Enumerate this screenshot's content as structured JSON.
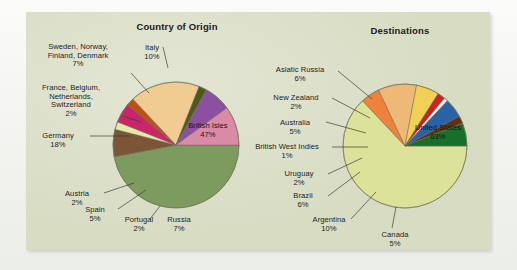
{
  "figure": {
    "background_color": "#d8dcc3",
    "page_color": "#f4f5f2"
  },
  "charts": [
    {
      "id": "country-of-origin",
      "title": "Country of Origin",
      "chart_data": {
        "type": "pie",
        "title": "Country of Origin",
        "xlabel": "",
        "ylabel": "",
        "unit": "percent",
        "start_angle_deg": 0,
        "direction": "clockwise",
        "categories": [
          "British Isles",
          "Russia",
          "Portugal",
          "Spain",
          "Austria",
          "Germany",
          "France, Belgium, Netherlands, Switzerland",
          "Sweden, Norway, Finland, Denmark",
          "Italy"
        ],
        "values": [
          47,
          7,
          2,
          5,
          2,
          18,
          2,
          7,
          10
        ],
        "colors": [
          "#7d9b5e",
          "#7c5436",
          "#e4e8a8",
          "#c9256b",
          "#b95214",
          "#f0cc93",
          "#4b5b1c",
          "#8d4fa0",
          "#d98aa6"
        ],
        "labels": [
          {
            "name": "British Isles",
            "value": "47%",
            "text": "British Isles\n47%"
          },
          {
            "name": "Russia",
            "value": "7%",
            "text": "Russia\n7%"
          },
          {
            "name": "Portugal",
            "value": "2%",
            "text": "Portugal\n2%"
          },
          {
            "name": "Spain",
            "value": "5%",
            "text": "Spain\n5%"
          },
          {
            "name": "Austria",
            "value": "2%",
            "text": "Austria\n2%"
          },
          {
            "name": "Germany",
            "value": "18%",
            "text": "Germany\n18%"
          },
          {
            "name": "France, Belgium, Netherlands, Switzerland",
            "value": "2%",
            "text": "France, Belgium,\nNetherlands,\nSwitzerland\n2%"
          },
          {
            "name": "Sweden, Norway, Finland, Denmark",
            "value": "7%",
            "text": "Sweden, Norway,\nFinland, Denmark\n7%"
          },
          {
            "name": "Italy",
            "value": "10%",
            "text": "Italy\n10%"
          }
        ]
      }
    },
    {
      "id": "destinations",
      "title": "Destinations",
      "chart_data": {
        "type": "pie",
        "title": "Destinations",
        "xlabel": "",
        "ylabel": "",
        "unit": "percent",
        "start_angle_deg": 0,
        "direction": "clockwise",
        "categories": [
          "United States",
          "Canada",
          "Argentina",
          "Brazil",
          "Uruguay",
          "British West Indies",
          "Australia",
          "New Zealand",
          "Asiatic Russia"
        ],
        "values": [
          63,
          5,
          10,
          6,
          2,
          1,
          5,
          2,
          6
        ],
        "colors": [
          "#dde29a",
          "#f0813c",
          "#eeb877",
          "#f0d055",
          "#cf2026",
          "#ffffff",
          "#2a62a8",
          "#5e3315",
          "#17702a"
        ],
        "labels": [
          {
            "name": "United States",
            "value": "63%",
            "text": "United States\n63%"
          },
          {
            "name": "Canada",
            "value": "5%",
            "text": "Canada\n5%"
          },
          {
            "name": "Argentina",
            "value": "10%",
            "text": "Argentina\n10%"
          },
          {
            "name": "Brazil",
            "value": "6%",
            "text": "Brazil\n6%"
          },
          {
            "name": "Uruguay",
            "value": "2%",
            "text": "Uruguay\n2%"
          },
          {
            "name": "British West Indies",
            "value": "1%",
            "text": "British West Indies\n1%"
          },
          {
            "name": "Australia",
            "value": "5%",
            "text": "Australia\n5%"
          },
          {
            "name": "New Zealand",
            "value": "2%",
            "text": "New Zealand\n2%"
          },
          {
            "name": "Asiatic Russia",
            "value": "6%",
            "text": "Asiatic Russia\n6%"
          }
        ]
      }
    }
  ],
  "callouts": {
    "origin": {
      "sweden": "Sweden, Norway,\nFinland, Denmark\n7%",
      "france": "France, Belgium,\nNetherlands,\nSwitzerland\n2%",
      "germany": "Germany\n18%",
      "austria": "Austria\n2%",
      "spain": "Spain\n5%",
      "portugal": "Portugal\n2%",
      "russia": "Russia\n7%",
      "italy": "Italy\n10%",
      "british_isles": "British Isles\n47%"
    },
    "destinations": {
      "asiatic_russia": "Asiatic Russia\n6%",
      "new_zealand": "New Zealand\n2%",
      "australia": "Australia\n5%",
      "bwi": "British West Indies\n1%",
      "uruguay": "Uruguay\n2%",
      "brazil": "Brazil\n6%",
      "argentina": "Argentina\n10%",
      "canada": "Canada\n5%",
      "united_states": "United States\n63%"
    }
  }
}
